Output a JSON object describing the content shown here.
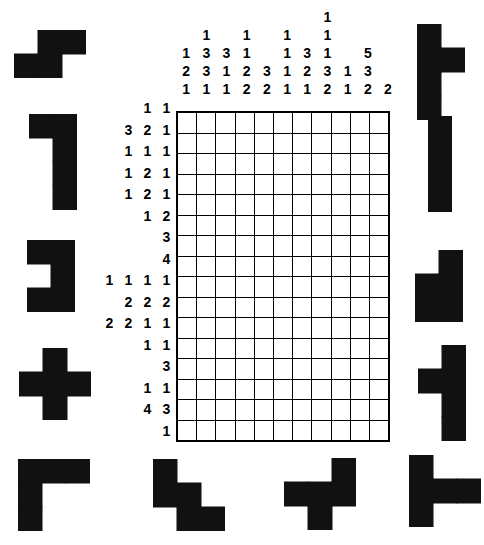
{
  "puzzle": {
    "type": "nonogram",
    "title": "Nonogram Puzzle",
    "grid": {
      "columns": 11,
      "rows": 16,
      "filled": []
    },
    "column_clues": [
      [
        1,
        2,
        1
      ],
      [
        1,
        3,
        3,
        1
      ],
      [
        3,
        1,
        1
      ],
      [
        1,
        1,
        2,
        2
      ],
      [
        3,
        2
      ],
      [
        1,
        1,
        1,
        1
      ],
      [
        3,
        2,
        1
      ],
      [
        1,
        1,
        1,
        3,
        2
      ],
      [
        1,
        1
      ],
      [
        5,
        3,
        2
      ],
      [
        2
      ]
    ],
    "row_clues": [
      [
        1,
        1
      ],
      [
        3,
        2,
        1
      ],
      [
        1,
        1,
        1
      ],
      [
        1,
        2,
        1
      ],
      [
        1,
        2,
        1
      ],
      [
        1,
        2
      ],
      [
        3
      ],
      [
        4
      ],
      [
        1,
        1,
        1,
        1
      ],
      [
        2,
        2,
        2
      ],
      [
        2,
        2,
        1,
        1
      ],
      [
        1,
        1
      ],
      [
        3
      ],
      [
        1,
        1
      ],
      [
        4,
        3
      ],
      [
        1
      ]
    ],
    "colors": {
      "grid_line": "#000000",
      "grid_border": "#000000",
      "clue_text": "#000000",
      "piece_fill": "#111111",
      "background": "#ffffff"
    }
  },
  "pieces": [
    {
      "id": "piece-s-left",
      "name": "s-tetromino",
      "side": "left",
      "index": 1,
      "cells": [
        [
          1,
          0
        ],
        [
          1,
          1
        ],
        [
          0,
          1
        ],
        [
          0,
          2
        ]
      ],
      "grid": [
        3,
        2
      ]
    },
    {
      "id": "piece-j-left",
      "name": "j-piece",
      "side": "left",
      "index": 2,
      "cells": [
        [
          0,
          0
        ],
        [
          0,
          1
        ],
        [
          1,
          1
        ],
        [
          2,
          1
        ],
        [
          3,
          1
        ]
      ],
      "grid": [
        2,
        4
      ]
    },
    {
      "id": "piece-bracket-left",
      "name": "c-bracket-piece",
      "side": "left",
      "index": 3,
      "cells": [
        [
          0,
          0
        ],
        [
          0,
          1
        ],
        [
          1,
          1
        ],
        [
          2,
          0
        ],
        [
          2,
          1
        ]
      ],
      "grid": [
        2,
        3
      ]
    },
    {
      "id": "piece-plus-left",
      "name": "plus-piece",
      "side": "left",
      "index": 4,
      "cells": [
        [
          0,
          1
        ],
        [
          1,
          0
        ],
        [
          1,
          1
        ],
        [
          1,
          2
        ],
        [
          2,
          1
        ]
      ],
      "grid": [
        3,
        3
      ]
    },
    {
      "id": "piece-gamma-left",
      "name": "gamma-corner-piece",
      "side": "left",
      "index": 5,
      "cells": [
        [
          0,
          0
        ],
        [
          0,
          1
        ],
        [
          0,
          2
        ],
        [
          1,
          0
        ],
        [
          2,
          0
        ]
      ],
      "grid": [
        3,
        3
      ]
    },
    {
      "id": "piece-stair-bottom",
      "name": "w-staircase-piece",
      "side": "bottom",
      "index": 1,
      "cells": [
        [
          0,
          0
        ],
        [
          1,
          0
        ],
        [
          1,
          1
        ],
        [
          2,
          1
        ],
        [
          2,
          2
        ]
      ],
      "grid": [
        3,
        3
      ]
    },
    {
      "id": "piece-t-bottom",
      "name": "t-cross-piece",
      "side": "bottom",
      "index": 2,
      "cells": [
        [
          0,
          2
        ],
        [
          1,
          0
        ],
        [
          1,
          1
        ],
        [
          1,
          2
        ],
        [
          2,
          1
        ]
      ],
      "grid": [
        3,
        3
      ]
    },
    {
      "id": "piece-sideways-t",
      "name": "sideways-t-piece",
      "side": "bottom",
      "index": 3,
      "cells": [
        [
          0,
          0
        ],
        [
          1,
          0
        ],
        [
          1,
          1
        ],
        [
          1,
          2
        ],
        [
          2,
          0
        ]
      ],
      "grid": [
        3,
        3
      ]
    },
    {
      "id": "piece-r-right",
      "name": "r-nub-piece",
      "side": "right",
      "index": 1,
      "cells": [
        [
          0,
          0
        ],
        [
          1,
          0
        ],
        [
          1,
          1
        ],
        [
          2,
          0
        ],
        [
          3,
          0
        ]
      ],
      "grid": [
        2,
        4
      ]
    },
    {
      "id": "piece-ibar-right",
      "name": "i-bar-piece",
      "side": "right",
      "index": 2,
      "cells": [
        [
          0,
          0
        ],
        [
          1,
          0
        ],
        [
          2,
          0
        ],
        [
          3,
          0
        ]
      ],
      "grid": [
        1,
        4
      ]
    },
    {
      "id": "piece-p-right",
      "name": "p-pentomino-piece",
      "side": "right",
      "index": 3,
      "cells": [
        [
          0,
          1
        ],
        [
          1,
          0
        ],
        [
          1,
          1
        ],
        [
          2,
          0
        ],
        [
          2,
          1
        ]
      ],
      "grid": [
        2,
        3
      ]
    },
    {
      "id": "piece-left-nub-right",
      "name": "left-nub-piece",
      "side": "right",
      "index": 4,
      "cells": [
        [
          0,
          1
        ],
        [
          1,
          0
        ],
        [
          1,
          1
        ],
        [
          2,
          1
        ],
        [
          3,
          1
        ]
      ],
      "grid": [
        2,
        4
      ]
    }
  ]
}
